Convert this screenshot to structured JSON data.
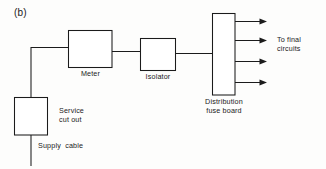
{
  "figure": {
    "panel_label": "(b)",
    "caption_absent": true
  },
  "diagram": {
    "type": "single-line-electrical-schematic",
    "stroke_color": "#1b1b1b",
    "background_color": "#fdfdfc",
    "blocks": [
      {
        "id": "service-cut-out",
        "label": "Service\ncut out",
        "label_line_1": "Service",
        "label_line_2": "cut out",
        "shape": "rectangle",
        "label_position": "right"
      },
      {
        "id": "meter",
        "label": "Meter",
        "shape": "rectangle",
        "label_position": "below"
      },
      {
        "id": "isolator",
        "label": "Isolator",
        "shape": "rectangle",
        "label_position": "below"
      },
      {
        "id": "distribution-fuse-board",
        "label": "Distribution\nfuse board",
        "label_line_1": "Distribution",
        "label_line_2": "fuse board",
        "shape": "tall-rectangle",
        "label_position": "below"
      }
    ],
    "conductors": [
      {
        "id": "supply-cable",
        "label": "Supply  cable",
        "label_position": "right"
      },
      {
        "id": "cutout-to-meter",
        "label": ""
      },
      {
        "id": "meter-to-isolator",
        "label": ""
      },
      {
        "id": "isolator-to-fuseboard",
        "label": ""
      }
    ],
    "outgoing": {
      "label_line_1": "To final",
      "label_line_2": "circuits",
      "count": 4,
      "arrow_style": "solid-filled-head"
    }
  }
}
